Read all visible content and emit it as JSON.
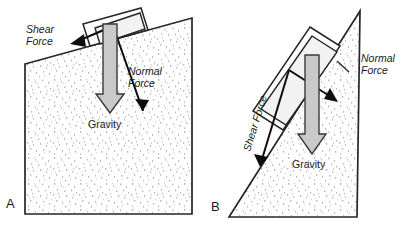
{
  "figure": {
    "background_color": "#ffffff",
    "outline_color": "#262626",
    "ground_fill_color": "#ffffff",
    "stipple_color": "#b5b5b5",
    "gravity_arrow_fill": "#c9c9c9",
    "gravity_arrow_stroke": "#3a3a3a",
    "force_vector_color": "#0d0d0d",
    "block_fill": "#ffffff"
  },
  "panels": [
    {
      "id": "A",
      "panel_label": "A",
      "slope_description": "gentle slope",
      "labels": {
        "shear_force_line1": "Shear",
        "shear_force_line2": "Force",
        "normal_force_line1": "Normal",
        "normal_force_line2": "Force",
        "gravity": "Gravity"
      }
    },
    {
      "id": "B",
      "panel_label": "B",
      "slope_description": "steep slope",
      "labels": {
        "shear_force": "Shear Force",
        "normal_force_line1": "Normal",
        "normal_force_line2": "Force",
        "gravity": "Gravity"
      }
    }
  ]
}
